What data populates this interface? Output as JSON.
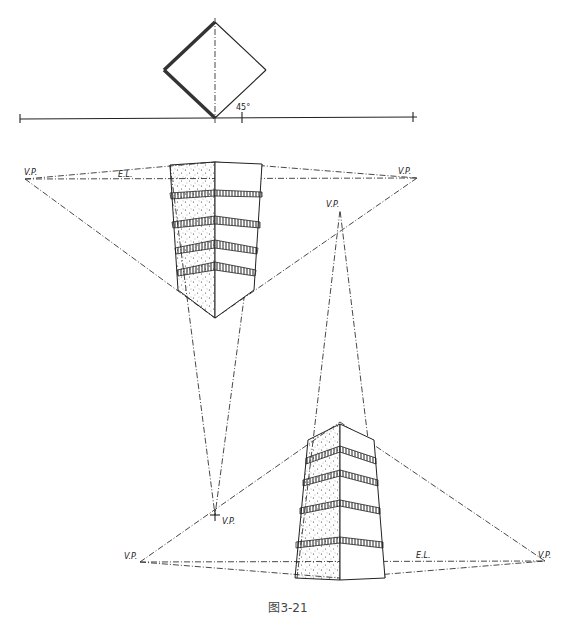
{
  "figure": {
    "caption": "图3-21",
    "top_plan": {
      "angle_label": "45°"
    },
    "upper_view": {
      "vp_left": "V.P.",
      "vp_right": "V.P.",
      "vp_third": "V.P.",
      "eye_level": "E.L."
    },
    "lower_view": {
      "vp_left": "V.P.",
      "vp_right": "V.P.",
      "vp_third": "V.P.",
      "eye_level": "E.L."
    }
  },
  "colors": {
    "ink": "#222222",
    "paper": "#ffffff",
    "caption": "#444444"
  }
}
